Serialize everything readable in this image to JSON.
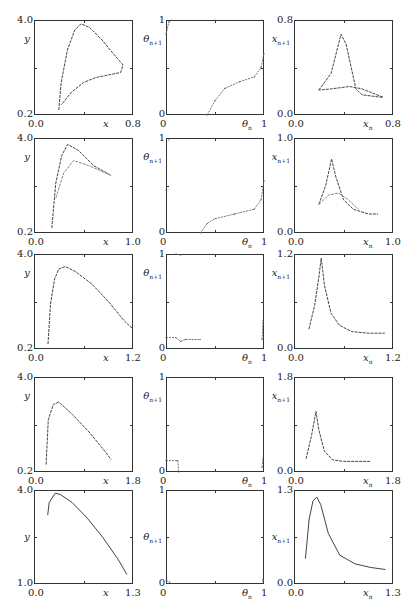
{
  "figure": {
    "rows": 5,
    "columns": [
      "y vs x attractor",
      "theta_{n+1} vs theta_n return map",
      "x_{n+1} vs x_n return map"
    ]
  },
  "chart_data": [
    {
      "row": 1,
      "col": 1,
      "type": "line",
      "xlabel": "x",
      "ylabel": "y",
      "xlim": [
        0.0,
        0.8
      ],
      "ylim": [
        0.2,
        4.0
      ],
      "xtick_labels": [
        "0.0",
        "0.8"
      ],
      "ytick_labels": [
        "0.2",
        "4.0"
      ],
      "points": [
        [
          0.2,
          0.4
        ],
        [
          0.22,
          1.5
        ],
        [
          0.27,
          2.8
        ],
        [
          0.33,
          3.6
        ],
        [
          0.38,
          3.85
        ],
        [
          0.45,
          3.7
        ],
        [
          0.55,
          3.2
        ],
        [
          0.65,
          2.6
        ],
        [
          0.72,
          2.2
        ],
        [
          0.7,
          1.9
        ],
        [
          0.6,
          1.8
        ],
        [
          0.5,
          1.7
        ],
        [
          0.4,
          1.5
        ],
        [
          0.3,
          1.1
        ],
        [
          0.22,
          0.6
        ]
      ]
    },
    {
      "row": 1,
      "col": 2,
      "type": "scatter",
      "xlabel": "θn",
      "ylabel": "θn+1",
      "xlim": [
        0,
        1
      ],
      "ylim": [
        0,
        1
      ],
      "xtick_labels": [
        "0",
        "1"
      ],
      "ytick_labels": [
        "0",
        "1"
      ],
      "points": [
        [
          0.0,
          0.85
        ],
        [
          0.03,
          0.98
        ],
        [
          0.06,
          1.0
        ],
        [
          0.5,
          1.0
        ],
        [
          0.98,
          1.0
        ],
        [
          0.42,
          0.0
        ],
        [
          0.5,
          0.15
        ],
        [
          0.6,
          0.28
        ],
        [
          0.75,
          0.35
        ],
        [
          0.9,
          0.4
        ],
        [
          0.97,
          0.5
        ],
        [
          1.0,
          0.65
        ]
      ]
    },
    {
      "row": 1,
      "col": 3,
      "type": "line",
      "xlabel": "xn",
      "ylabel": "xn+1",
      "xlim": [
        0.0,
        0.8
      ],
      "ylim": [
        0.0,
        0.8
      ],
      "xtick_labels": [
        "0.0",
        "0.8"
      ],
      "ytick_labels": [
        "0.0",
        "0.8"
      ],
      "points": [
        [
          0.2,
          0.21
        ],
        [
          0.3,
          0.35
        ],
        [
          0.38,
          0.68
        ],
        [
          0.42,
          0.6
        ],
        [
          0.5,
          0.22
        ],
        [
          0.55,
          0.17
        ],
        [
          0.7,
          0.15
        ],
        [
          0.72,
          0.15
        ],
        [
          0.55,
          0.22
        ],
        [
          0.45,
          0.24
        ],
        [
          0.3,
          0.22
        ],
        [
          0.2,
          0.21
        ]
      ]
    },
    {
      "row": 2,
      "col": 1,
      "type": "line",
      "xlabel": "x",
      "ylabel": "y",
      "xlim": [
        0.0,
        1.0
      ],
      "ylim": [
        0.2,
        4.0
      ],
      "xtick_labels": [
        "0.0",
        "1.0"
      ],
      "ytick_labels": [
        "0.2",
        "4.0"
      ],
      "series": [
        {
          "name": "upper branch",
          "points": [
            [
              0.18,
              0.4
            ],
            [
              0.22,
              2.2
            ],
            [
              0.28,
              3.3
            ],
            [
              0.34,
              3.75
            ],
            [
              0.45,
              3.5
            ],
            [
              0.6,
              2.9
            ],
            [
              0.78,
              2.5
            ]
          ]
        },
        {
          "name": "lower branch",
          "points": [
            [
              0.22,
              1.6
            ],
            [
              0.3,
              2.6
            ],
            [
              0.4,
              3.1
            ],
            [
              0.55,
              2.9
            ],
            [
              0.78,
              2.5
            ]
          ]
        }
      ]
    },
    {
      "row": 2,
      "col": 2,
      "type": "scatter",
      "xlabel": "θn",
      "ylabel": "θn+1",
      "xlim": [
        0,
        1
      ],
      "ylim": [
        0,
        1
      ],
      "xtick_labels": [
        "0",
        "1"
      ],
      "ytick_labels": [
        "0",
        "1"
      ],
      "points": [
        [
          0.0,
          0.45
        ],
        [
          0.03,
          0.98
        ],
        [
          0.35,
          0.0
        ],
        [
          0.42,
          0.1
        ],
        [
          0.5,
          0.15
        ],
        [
          0.7,
          0.2
        ],
        [
          0.9,
          0.25
        ],
        [
          0.97,
          0.35
        ],
        [
          1.0,
          0.55
        ]
      ]
    },
    {
      "row": 2,
      "col": 3,
      "type": "line",
      "xlabel": "xn",
      "ylabel": "xn+1",
      "xlim": [
        0.0,
        1.0
      ],
      "ylim": [
        0.0,
        1.0
      ],
      "xtick_labels": [
        "0.0",
        "1.0"
      ],
      "ytick_labels": [
        "0.0",
        "1.0"
      ],
      "series": [
        {
          "name": "tall peak",
          "points": [
            [
              0.25,
              0.3
            ],
            [
              0.32,
              0.5
            ],
            [
              0.38,
              0.78
            ],
            [
              0.42,
              0.6
            ],
            [
              0.5,
              0.35
            ],
            [
              0.6,
              0.25
            ],
            [
              0.75,
              0.2
            ],
            [
              0.85,
              0.2
            ]
          ]
        },
        {
          "name": "low peak",
          "points": [
            [
              0.25,
              0.3
            ],
            [
              0.35,
              0.4
            ],
            [
              0.45,
              0.42
            ],
            [
              0.55,
              0.35
            ],
            [
              0.65,
              0.25
            ]
          ]
        }
      ]
    },
    {
      "row": 3,
      "col": 1,
      "type": "line",
      "xlabel": "x",
      "ylabel": "y",
      "xlim": [
        0.0,
        1.2
      ],
      "ylim": [
        0.2,
        4.0
      ],
      "xtick_labels": [
        "0.0",
        "1.2"
      ],
      "ytick_labels": [
        "0.2",
        "4.0"
      ],
      "points": [
        [
          0.17,
          0.4
        ],
        [
          0.2,
          2.0
        ],
        [
          0.25,
          3.0
        ],
        [
          0.3,
          3.4
        ],
        [
          0.38,
          3.5
        ],
        [
          0.5,
          3.3
        ],
        [
          0.7,
          2.8
        ],
        [
          0.9,
          2.1
        ],
        [
          1.1,
          1.3
        ],
        [
          1.2,
          1.0
        ]
      ]
    },
    {
      "row": 3,
      "col": 2,
      "type": "scatter",
      "xlabel": "θn",
      "ylabel": "θn+1",
      "xlim": [
        0,
        1
      ],
      "ylim": [
        0,
        1
      ],
      "xtick_labels": [
        "0",
        "1"
      ],
      "ytick_labels": [
        "0",
        "1"
      ],
      "points": [
        [
          0.1,
          1.0
        ],
        [
          0.15,
          0.99
        ],
        [
          0.0,
          0.12
        ],
        [
          0.1,
          0.12
        ],
        [
          0.15,
          0.08
        ],
        [
          0.2,
          0.1
        ],
        [
          0.35,
          0.1
        ],
        [
          0.98,
          0.1
        ],
        [
          0.99,
          0.3
        ]
      ]
    },
    {
      "row": 3,
      "col": 3,
      "type": "line",
      "xlabel": "xn",
      "ylabel": "xn+1",
      "xlim": [
        0.0,
        1.2
      ],
      "ylim": [
        0.0,
        1.2
      ],
      "xtick_labels": [
        "0.0",
        "1.2"
      ],
      "ytick_labels": [
        "0.0",
        "1.2"
      ],
      "points": [
        [
          0.18,
          0.25
        ],
        [
          0.25,
          0.55
        ],
        [
          0.3,
          0.9
        ],
        [
          0.33,
          1.15
        ],
        [
          0.37,
          0.8
        ],
        [
          0.45,
          0.45
        ],
        [
          0.55,
          0.3
        ],
        [
          0.7,
          0.22
        ],
        [
          0.9,
          0.2
        ],
        [
          1.1,
          0.2
        ]
      ]
    },
    {
      "row": 4,
      "col": 1,
      "type": "line",
      "xlabel": "x",
      "ylabel": "y",
      "xlim": [
        0.0,
        1.8
      ],
      "ylim": [
        0.2,
        4.0
      ],
      "xtick_labels": [
        "0.0",
        "1.8"
      ],
      "ytick_labels": [
        "0.2",
        "4.0"
      ],
      "points": [
        [
          0.22,
          0.5
        ],
        [
          0.26,
          2.3
        ],
        [
          0.35,
          2.9
        ],
        [
          0.45,
          3.0
        ],
        [
          0.7,
          2.5
        ],
        [
          1.0,
          1.8
        ],
        [
          1.3,
          1.0
        ],
        [
          1.4,
          0.7
        ]
      ]
    },
    {
      "row": 4,
      "col": 2,
      "type": "scatter",
      "xlabel": "θn",
      "ylabel": "θn+1",
      "xlim": [
        0,
        1
      ],
      "ylim": [
        0,
        1
      ],
      "xtick_labels": [
        "0",
        "1"
      ],
      "ytick_labels": [
        "0",
        "1"
      ],
      "points": [
        [
          0.0,
          0.12
        ],
        [
          0.12,
          0.12
        ],
        [
          0.13,
          0.0
        ],
        [
          0.98,
          0.05
        ],
        [
          0.99,
          0.15
        ]
      ]
    },
    {
      "row": 4,
      "col": 3,
      "type": "line",
      "xlabel": "xn",
      "ylabel": "xn+1",
      "xlim": [
        0.0,
        1.8
      ],
      "ylim": [
        0.0,
        1.8
      ],
      "xtick_labels": [
        "0.0",
        "1.8"
      ],
      "ytick_labels": [
        "0.0",
        "1.8"
      ],
      "points": [
        [
          0.22,
          0.25
        ],
        [
          0.32,
          0.7
        ],
        [
          0.4,
          1.15
        ],
        [
          0.45,
          0.8
        ],
        [
          0.55,
          0.4
        ],
        [
          0.7,
          0.23
        ],
        [
          0.9,
          0.2
        ],
        [
          1.2,
          0.2
        ],
        [
          1.4,
          0.2
        ]
      ]
    },
    {
      "row": 5,
      "col": 1,
      "type": "line",
      "xlabel": "x",
      "ylabel": "y",
      "xlim": [
        0.0,
        1.3
      ],
      "ylim": [
        1.0,
        4.0
      ],
      "xtick_labels": [
        "0.0",
        "1.3"
      ],
      "ytick_labels": [
        "1.0",
        "4.0"
      ],
      "points": [
        [
          0.18,
          3.2
        ],
        [
          0.2,
          3.6
        ],
        [
          0.28,
          3.9
        ],
        [
          0.35,
          3.85
        ],
        [
          0.5,
          3.6
        ],
        [
          0.7,
          3.1
        ],
        [
          0.9,
          2.5
        ],
        [
          1.1,
          1.8
        ],
        [
          1.22,
          1.3
        ]
      ]
    },
    {
      "row": 5,
      "col": 2,
      "type": "scatter",
      "xlabel": "θn",
      "ylabel": "θn+1",
      "xlim": [
        0,
        1
      ],
      "ylim": [
        0,
        1
      ],
      "xtick_labels": [
        "0",
        "1"
      ],
      "ytick_labels": [
        "0",
        "1"
      ],
      "points": [
        [
          0.0,
          0.04
        ],
        [
          0.04,
          0.02
        ],
        [
          0.99,
          0.03
        ],
        [
          0.99,
          0.05
        ]
      ]
    },
    {
      "row": 5,
      "col": 3,
      "type": "line",
      "xlabel": "xn",
      "ylabel": "xn+1",
      "xlim": [
        0.0,
        1.3
      ],
      "ylim": [
        0.0,
        1.3
      ],
      "xtick_labels": [
        "0.0",
        "1.3"
      ],
      "ytick_labels": [
        "0.0",
        "1.3"
      ],
      "points": [
        [
          0.15,
          0.35
        ],
        [
          0.2,
          0.9
        ],
        [
          0.25,
          1.15
        ],
        [
          0.3,
          1.2
        ],
        [
          0.35,
          1.1
        ],
        [
          0.45,
          0.7
        ],
        [
          0.6,
          0.4
        ],
        [
          0.8,
          0.28
        ],
        [
          1.0,
          0.23
        ],
        [
          1.2,
          0.2
        ]
      ]
    }
  ]
}
